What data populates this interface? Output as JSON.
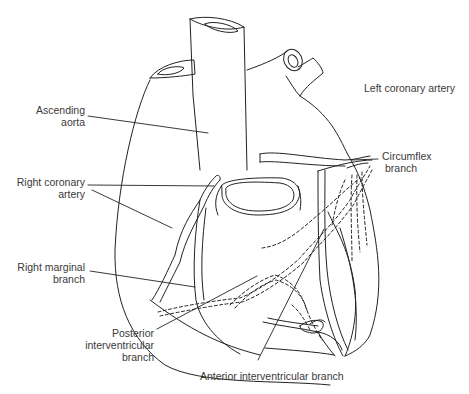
{
  "diagram": {
    "line_color": "#222222",
    "text_color": "#3a3a3a",
    "background": "#ffffff"
  },
  "labels": {
    "ascending_aorta": {
      "line1": "Ascending",
      "line2": "aorta"
    },
    "right_coronary_artery": {
      "line1": "Right coronary",
      "line2": "artery"
    },
    "right_marginal_branch": {
      "line1": "Right marginal",
      "line2": "branch"
    },
    "posterior_interventricular_branch": {
      "line1": "Posterior",
      "line2": "interventricular",
      "line3": "branch"
    },
    "anterior_interventricular_branch": {
      "line1": "Anterior interventricular branch"
    },
    "left_coronary_artery": {
      "line1": "Left coronary artery"
    },
    "circumflex_branch": {
      "line1": "Circumflex",
      "line2": "branch"
    }
  }
}
